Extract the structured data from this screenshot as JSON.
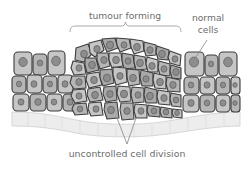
{
  "figure": {
    "kind": "biology-diagram",
    "background_color": "#ffffff"
  },
  "labels": {
    "tumour_forming": "tumour forming",
    "normal_cells_line1": "normal",
    "normal_cells_line2": "cells",
    "caption": "uncontrolled cell division"
  },
  "colors": {
    "text": "#6d6d6d",
    "leader_line": "#8a8a8a",
    "brace": "#9a9a9a",
    "cell_fill_light": "#c6c6c6",
    "cell_fill_mid": "#b6b6b6",
    "cell_fill_dark": "#a9a9a9",
    "cell_outline": "#3d3d3d",
    "nucleus_fill": "#8d8d8d",
    "nucleus_outline": "#5a5a5a",
    "membrane_fill": "#ededed",
    "membrane_outline": "#cfcfcf"
  },
  "annotations": {
    "brace_span_x": [
      70,
      181
    ],
    "brace_tip_x": 125,
    "normal_cells_leader_from": [
      207,
      40
    ],
    "normal_cells_leader_to": [
      196,
      57
    ],
    "caption_leaders_from": [
      [
        117,
        118
      ],
      [
        136,
        118
      ]
    ],
    "caption_leaders_to": [
      127,
      144
    ]
  },
  "chart_data": {
    "type": "diagram",
    "title": "tumour forming",
    "regions": [
      {
        "name": "normal-tissue-left",
        "x_range": [
          12,
          72
        ],
        "description": "regular ordered epithelial cells in neat rows"
      },
      {
        "name": "tumour-mass",
        "x_range": [
          72,
          182
        ],
        "description": "irregular disorganised cells of varying size and shape, bulging upward"
      },
      {
        "name": "normal-tissue-right",
        "x_range": [
          182,
          240
        ],
        "description": "regular ordered epithelial cells in neat rows"
      },
      {
        "name": "basement-membrane",
        "y_range": [
          112,
          130
        ],
        "description": "pale wavy layer beneath the epithelium"
      }
    ],
    "normal_cells_left": [
      {
        "x": 14,
        "y": 52,
        "w": 18,
        "h": 23,
        "r": 4,
        "nx": 23,
        "ny": 62,
        "nr": 4.2,
        "tone": "light"
      },
      {
        "x": 33,
        "y": 54,
        "w": 14,
        "h": 21,
        "r": 4,
        "nx": 40,
        "ny": 63,
        "nr": 2.8,
        "tone": "mid"
      },
      {
        "x": 48,
        "y": 51,
        "w": 17,
        "h": 24,
        "r": 4,
        "nx": 56,
        "ny": 61,
        "nr": 4.4,
        "tone": "light"
      },
      {
        "x": 12,
        "y": 76,
        "w": 14,
        "h": 17,
        "r": 4,
        "nx": 19,
        "ny": 84,
        "nr": 2.6,
        "tone": "mid"
      },
      {
        "x": 27,
        "y": 75,
        "w": 15,
        "h": 18,
        "r": 4,
        "nx": 34,
        "ny": 84,
        "nr": 3.0,
        "tone": "light"
      },
      {
        "x": 43,
        "y": 76,
        "w": 14,
        "h": 17,
        "r": 4,
        "nx": 50,
        "ny": 84,
        "nr": 2.6,
        "tone": "mid"
      },
      {
        "x": 58,
        "y": 75,
        "w": 15,
        "h": 18,
        "r": 4,
        "nx": 65,
        "ny": 84,
        "nr": 3.0,
        "tone": "light"
      },
      {
        "x": 13,
        "y": 94,
        "w": 16,
        "h": 16,
        "r": 4,
        "nx": 21,
        "ny": 102,
        "nr": 3.0,
        "tone": "light"
      },
      {
        "x": 30,
        "y": 94,
        "w": 16,
        "h": 16,
        "r": 4,
        "nx": 38,
        "ny": 102,
        "nr": 3.2,
        "tone": "mid"
      },
      {
        "x": 47,
        "y": 94,
        "w": 15,
        "h": 16,
        "r": 4,
        "nx": 54,
        "ny": 102,
        "nr": 2.8,
        "tone": "light"
      },
      {
        "x": 63,
        "y": 94,
        "w": 15,
        "h": 16,
        "r": 4,
        "nx": 70,
        "ny": 102,
        "nr": 3.0,
        "tone": "mid"
      }
    ],
    "normal_cells_right": [
      {
        "x": 185,
        "y": 52,
        "w": 19,
        "h": 24,
        "r": 4,
        "nx": 194,
        "ny": 62,
        "nr": 4.6,
        "tone": "light"
      },
      {
        "x": 205,
        "y": 55,
        "w": 13,
        "h": 21,
        "r": 4,
        "nx": 211,
        "ny": 64,
        "nr": 2.6,
        "tone": "mid"
      },
      {
        "x": 219,
        "y": 52,
        "w": 18,
        "h": 24,
        "r": 4,
        "nx": 228,
        "ny": 62,
        "nr": 4.4,
        "tone": "light"
      },
      {
        "x": 184,
        "y": 77,
        "w": 15,
        "h": 17,
        "r": 4,
        "nx": 191,
        "ny": 85,
        "nr": 2.8,
        "tone": "mid"
      },
      {
        "x": 200,
        "y": 77,
        "w": 15,
        "h": 17,
        "r": 4,
        "nx": 207,
        "ny": 85,
        "nr": 3.0,
        "tone": "light"
      },
      {
        "x": 216,
        "y": 77,
        "w": 14,
        "h": 17,
        "r": 4,
        "nx": 223,
        "ny": 85,
        "nr": 2.6,
        "tone": "mid"
      },
      {
        "x": 231,
        "y": 77,
        "w": 9,
        "h": 17,
        "r": 3,
        "nx": 235,
        "ny": 85,
        "nr": 2.2,
        "tone": "light"
      },
      {
        "x": 183,
        "y": 95,
        "w": 16,
        "h": 16,
        "r": 4,
        "nx": 191,
        "ny": 103,
        "nr": 3.2,
        "tone": "light"
      },
      {
        "x": 200,
        "y": 95,
        "w": 15,
        "h": 16,
        "r": 4,
        "nx": 207,
        "ny": 103,
        "nr": 2.8,
        "tone": "mid"
      },
      {
        "x": 216,
        "y": 95,
        "w": 14,
        "h": 16,
        "r": 4,
        "nx": 223,
        "ny": 103,
        "nr": 3.0,
        "tone": "light"
      },
      {
        "x": 231,
        "y": 95,
        "w": 9,
        "h": 16,
        "r": 3,
        "nx": 235,
        "ny": 103,
        "nr": 2.2,
        "tone": "mid"
      }
    ],
    "tumour_cells": [
      {
        "pts": "76,48 88,44 92,54 84,62 75,60",
        "nx": 84,
        "ny": 54,
        "nr": 3.4,
        "tone": "mid"
      },
      {
        "pts": "89,43 101,40 104,50 95,57 90,53",
        "nx": 97,
        "ny": 49,
        "nr": 3.2,
        "tone": "light"
      },
      {
        "pts": "102,39 115,38 118,48 107,52 104,45",
        "nx": 110,
        "ny": 45,
        "nr": 3.6,
        "tone": "dark"
      },
      {
        "pts": "116,38 129,39 131,48 120,52 117,45",
        "nx": 124,
        "ny": 45,
        "nr": 3.0,
        "tone": "mid"
      },
      {
        "pts": "130,39 143,41 144,51 134,54 131,47",
        "nx": 137,
        "ny": 47,
        "nr": 3.4,
        "tone": "light"
      },
      {
        "pts": "144,42 156,45 156,55 146,56 144,49",
        "nx": 150,
        "ny": 50,
        "nr": 3.2,
        "tone": "mid"
      },
      {
        "pts": "157,46 169,50 168,60 158,59 156,52",
        "nx": 162,
        "ny": 54,
        "nr": 3.4,
        "tone": "dark"
      },
      {
        "pts": "170,51 181,55 180,66 170,63 168,57",
        "nx": 175,
        "ny": 59,
        "nr": 3.0,
        "tone": "light"
      },
      {
        "pts": "73,61 84,63 86,74 74,75 71,68",
        "nx": 79,
        "ny": 68,
        "nr": 3.0,
        "tone": "light"
      },
      {
        "pts": "85,58 96,58 99,70 87,73 85,65",
        "nx": 92,
        "ny": 65,
        "nr": 3.4,
        "tone": "dark"
      },
      {
        "pts": "97,53 108,53 110,66 100,69 97,60",
        "nx": 104,
        "ny": 60,
        "nr": 3.2,
        "tone": "mid"
      },
      {
        "pts": "109,53 121,53 123,66 112,68 109,60",
        "nx": 116,
        "ny": 60,
        "nr": 3.4,
        "tone": "light"
      },
      {
        "pts": "122,53 133,55 135,68 124,69 122,60",
        "nx": 128,
        "ny": 61,
        "nr": 3.0,
        "tone": "dark"
      },
      {
        "pts": "134,55 145,57 147,69 136,70 134,62",
        "nx": 140,
        "ny": 63,
        "nr": 3.4,
        "tone": "mid"
      },
      {
        "pts": "147,57 158,60 158,72 148,72 146,64",
        "nx": 152,
        "ny": 66,
        "nr": 3.2,
        "tone": "light"
      },
      {
        "pts": "159,61 170,64 170,76 160,75 158,68",
        "nx": 164,
        "ny": 69,
        "nr": 3.0,
        "tone": "mid"
      },
      {
        "pts": "171,65 181,68 181,79 172,78 170,71",
        "nx": 176,
        "ny": 72,
        "nr": 3.2,
        "tone": "dark"
      },
      {
        "pts": "72,76 85,76 86,88 74,89 70,83",
        "nx": 79,
        "ny": 82,
        "nr": 3.2,
        "tone": "mid"
      },
      {
        "pts": "87,74 99,72 102,85 89,88 86,80",
        "nx": 94,
        "ny": 80,
        "nr": 3.4,
        "tone": "light"
      },
      {
        "pts": "100,70 112,69 114,83 103,86 100,78",
        "nx": 107,
        "ny": 78,
        "nr": 3.6,
        "tone": "dark"
      },
      {
        "pts": "113,67 126,68 127,82 116,85 113,75",
        "nx": 120,
        "ny": 76,
        "nr": 3.2,
        "tone": "light"
      },
      {
        "pts": "127,69 139,70 140,84 129,86 127,77",
        "nx": 133,
        "ny": 78,
        "nr": 3.4,
        "tone": "mid"
      },
      {
        "pts": "141,70 153,73 153,86 142,86 140,78",
        "nx": 146,
        "ny": 79,
        "nr": 3.0,
        "tone": "dark"
      },
      {
        "pts": "154,73 166,76 166,89 155,88 153,80",
        "nx": 160,
        "ny": 82,
        "nr": 3.4,
        "tone": "light"
      },
      {
        "pts": "167,77 180,80 180,92 168,91 166,84",
        "nx": 173,
        "ny": 85,
        "nr": 3.2,
        "tone": "mid"
      },
      {
        "pts": "73,90 85,89 87,101 75,103 71,96",
        "nx": 79,
        "ny": 96,
        "nr": 3.0,
        "tone": "light"
      },
      {
        "pts": "88,89 100,87 103,100 90,102 87,95",
        "nx": 95,
        "ny": 95,
        "nr": 3.4,
        "tone": "mid"
      },
      {
        "pts": "104,87 116,86 117,100 106,102 103,94",
        "nx": 110,
        "ny": 94,
        "nr": 3.2,
        "tone": "dark"
      },
      {
        "pts": "118,86 130,87 131,101 120,102 117,94",
        "nx": 124,
        "ny": 94,
        "nr": 3.6,
        "tone": "light"
      },
      {
        "pts": "132,87 144,88 144,102 133,103 131,95",
        "nx": 138,
        "ny": 95,
        "nr": 3.0,
        "tone": "mid"
      },
      {
        "pts": "145,87 157,90 157,103 146,103 144,95",
        "nx": 150,
        "ny": 96,
        "nr": 3.4,
        "tone": "dark"
      },
      {
        "pts": "158,90 170,92 170,105 159,104 157,97",
        "nx": 164,
        "ny": 98,
        "nr": 3.2,
        "tone": "light"
      },
      {
        "pts": "171,93 181,95 181,107 172,106 170,99",
        "nx": 176,
        "ny": 100,
        "nr": 2.8,
        "tone": "mid"
      },
      {
        "pts": "74,104 86,103 88,114 75,115 72,109",
        "nx": 80,
        "ny": 109,
        "nr": 2.8,
        "tone": "mid"
      },
      {
        "pts": "89,103 101,102 103,115 91,116 88,109",
        "nx": 96,
        "ny": 109,
        "nr": 3.0,
        "tone": "light"
      },
      {
        "pts": "105,103 117,102 119,118 107,119 104,110",
        "nx": 111,
        "ny": 110,
        "nr": 3.4,
        "tone": "dark"
      },
      {
        "pts": "121,103 133,103 134,119 122,120 120,110",
        "nx": 127,
        "ny": 111,
        "nr": 3.2,
        "tone": "mid"
      },
      {
        "pts": "135,104 147,105 147,118 136,118 134,111",
        "nx": 141,
        "ny": 111,
        "nr": 3.0,
        "tone": "light"
      },
      {
        "pts": "148,105 160,107 160,117 149,116 147,111",
        "nx": 154,
        "ny": 111,
        "nr": 2.8,
        "tone": "dark"
      },
      {
        "pts": "161,107 172,109 172,118 162,117 160,112",
        "nx": 166,
        "ny": 112,
        "nr": 2.8,
        "tone": "mid"
      },
      {
        "pts": "173,109 182,110 182,118 174,117 172,113",
        "nx": 177,
        "ny": 113,
        "nr": 2.4,
        "tone": "light"
      }
    ]
  }
}
